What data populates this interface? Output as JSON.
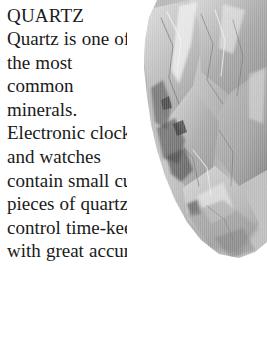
{
  "article": {
    "heading": "QUARTZ",
    "body": "Quartz is one of the most common minerals. Electronic clocks and watches contain small cut pieces of quartz that control time-keeping with great accuracy.",
    "lines": [
      "Quartz is",
      "one of",
      "the most",
      "common",
      "minerals.",
      "Electronic",
      "clocks and",
      "watches",
      "contain small",
      "cut pieces of",
      "quartz that control time-",
      "keeping with great accuracy."
    ]
  },
  "colors": {
    "page_background": "#ffffff",
    "text": "#1a1a1a",
    "photo_light": "#e8e8e8",
    "photo_mid": "#a8a8a8",
    "photo_dark": "#4a4a4a",
    "photo_shadow": "#2e2e2e"
  }
}
